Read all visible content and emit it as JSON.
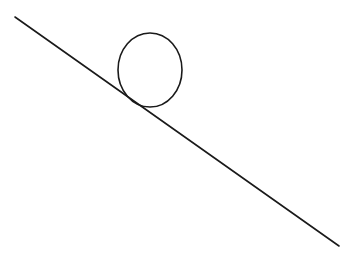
{
  "diagram": {
    "stroke_color": "#1a1a1a",
    "background": "#ffffff",
    "incline": {
      "x1": 15,
      "y1": 17,
      "x2": 339,
      "y2": 246,
      "stroke_width": 1.6
    },
    "circle": {
      "cx": 150,
      "cy": 70,
      "rx": 32,
      "ry": 37,
      "stroke_width": 1.6
    }
  }
}
